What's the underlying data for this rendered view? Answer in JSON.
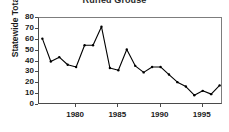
{
  "chart_data": {
    "type": "line",
    "title": "Ruffed Grouse",
    "xlabel": "",
    "ylabel": "Statewide Totals",
    "x": [
      1976,
      1977,
      1978,
      1979,
      1980,
      1981,
      1982,
      1983,
      1984,
      1985,
      1986,
      1987,
      1988,
      1989,
      1990,
      1991,
      1992,
      1993,
      1994,
      1995,
      1996,
      1997
    ],
    "values": [
      61,
      40,
      44,
      37,
      35,
      55,
      55,
      72,
      34,
      32,
      51,
      36,
      30,
      35,
      35,
      28,
      21,
      17,
      9,
      13,
      10,
      18
    ],
    "series": [
      {
        "name": "Ruffed Grouse",
        "values": [
          61,
          40,
          44,
          37,
          35,
          55,
          55,
          72,
          34,
          32,
          51,
          36,
          30,
          35,
          35,
          28,
          21,
          17,
          9,
          13,
          10,
          18
        ]
      }
    ],
    "xlim": [
      1975.6,
      1997.4
    ],
    "ylim": [
      0,
      80
    ],
    "yticks": [
      80,
      70,
      60,
      50,
      40,
      30,
      20,
      10,
      0
    ],
    "ytick_labels": [
      "80",
      "70",
      "60",
      "50",
      "40",
      "30",
      "20",
      "10",
      "0"
    ],
    "xticks": [
      1980,
      1985,
      1990,
      1995
    ],
    "xtick_labels": [
      "1980",
      "1985",
      "1990",
      "1995"
    ],
    "grid": false,
    "legend": false,
    "line_color": "#000000",
    "marker": "dot",
    "marker_color": "#000000",
    "axis_color": "#4a4a4a",
    "background": "#ffffff"
  }
}
